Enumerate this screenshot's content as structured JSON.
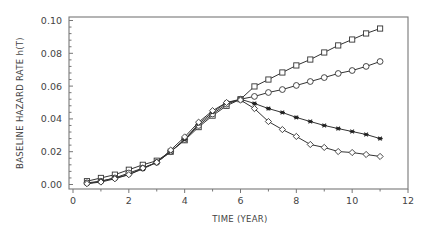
{
  "chart_data": {
    "type": "line",
    "title": "",
    "xlabel": "TIME (YEAR)",
    "ylabel": "BASELINE HAZARD RATE h(T)",
    "xlim": [
      0,
      12
    ],
    "ylim": [
      0.0,
      0.1
    ],
    "xticks": [
      0,
      2,
      4,
      6,
      8,
      10,
      12
    ],
    "xtick_labels": [
      "0",
      "2",
      "4",
      "6",
      "8",
      "10",
      "12"
    ],
    "yticks": [
      0.0,
      0.02,
      0.04,
      0.06,
      0.08,
      0.1
    ],
    "ytick_labels": [
      "0.00",
      "0.02",
      "0.04",
      "0.06",
      "0.08",
      "0.10"
    ],
    "grid": false,
    "legend": null,
    "x": [
      0.5,
      1,
      1.5,
      2,
      2.5,
      3,
      3.5,
      4,
      4.5,
      5,
      5.5,
      6,
      6.5,
      7,
      7.5,
      8,
      8.5,
      9,
      9.5,
      10,
      10.5,
      11
    ],
    "series": [
      {
        "name": "square",
        "marker": "square",
        "values": [
          0.002,
          0.004,
          0.006,
          0.009,
          0.012,
          0.0145,
          0.02,
          0.027,
          0.035,
          0.042,
          0.048,
          0.052,
          0.0598,
          0.064,
          0.0683,
          0.0726,
          0.0762,
          0.0805,
          0.0848,
          0.0884,
          0.0921,
          0.0951
        ]
      },
      {
        "name": "circle",
        "marker": "circle",
        "values": [
          0.001,
          0.002,
          0.004,
          0.007,
          0.01,
          0.0135,
          0.02,
          0.0275,
          0.036,
          0.043,
          0.049,
          0.052,
          0.0537,
          0.0561,
          0.0579,
          0.0604,
          0.0628,
          0.0652,
          0.0677,
          0.0695,
          0.072,
          0.075
        ]
      },
      {
        "name": "star",
        "marker": "star",
        "values": [
          0.0005,
          0.002,
          0.004,
          0.006,
          0.0095,
          0.0135,
          0.02,
          0.0275,
          0.037,
          0.044,
          0.05,
          0.052,
          0.0494,
          0.0463,
          0.0439,
          0.0409,
          0.0384,
          0.036,
          0.0341,
          0.0323,
          0.0305,
          0.028
        ]
      },
      {
        "name": "diamond",
        "marker": "diamond",
        "values": [
          0.0005,
          0.0015,
          0.0035,
          0.006,
          0.01,
          0.0135,
          0.021,
          0.029,
          0.038,
          0.045,
          0.05,
          0.0515,
          0.0463,
          0.0384,
          0.0335,
          0.0293,
          0.0244,
          0.0226,
          0.0201,
          0.0195,
          0.0183,
          0.0171
        ]
      }
    ]
  },
  "axes": {
    "x_title": "TIME (YEAR)",
    "y_title": "BASELINE HAZARD RATE h(T)"
  }
}
